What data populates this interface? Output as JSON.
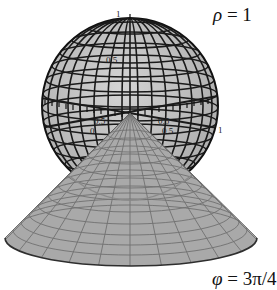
{
  "figure": {
    "sphere_label": {
      "symbol": "ρ",
      "equals": " = ",
      "value": "1"
    },
    "cone_label": {
      "symbol": "φ",
      "equals": " = ",
      "value": "3π/4"
    },
    "axis_ticks": {
      "z_top": "1",
      "z_mid": "0.5",
      "x_left": "0.5",
      "y_right": "0.5",
      "x_left_lower": "0",
      "y_right_lower": "0.5",
      "right_end": "1"
    },
    "colors": {
      "sphere_fill": "#bdbdbd",
      "sphere_grid": "#1a1a1a",
      "cone_fill": "#a9a9a9",
      "cone_grid": "#6e6e6e",
      "cone_edge": "#3a3a3a",
      "background": "#ffffff"
    }
  }
}
